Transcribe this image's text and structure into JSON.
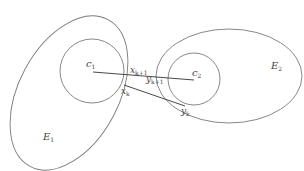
{
  "diagram": {
    "ellipses": [
      {
        "id": "E1",
        "label": "E",
        "sub": "1"
      },
      {
        "id": "E2",
        "label": "E",
        "sub": "2"
      }
    ],
    "circles": [
      {
        "id": "c1",
        "label": "c",
        "sub": "1"
      },
      {
        "id": "c2",
        "label": "c",
        "sub": "2"
      }
    ],
    "points": [
      {
        "id": "x_k1",
        "label": "x",
        "sub": "k+1"
      },
      {
        "id": "x_k",
        "label": "x",
        "sub": "k"
      },
      {
        "id": "y_k1",
        "label": "y",
        "sub": "k+1"
      },
      {
        "id": "y_k",
        "label": "y",
        "sub": "k"
      }
    ],
    "stroke_color": "#7a7a7a",
    "line_color": "#333333"
  }
}
